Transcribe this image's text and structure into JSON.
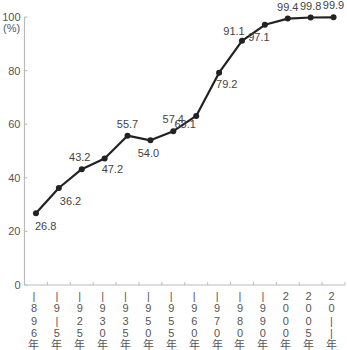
{
  "chart_data": {
    "type": "line",
    "title": "",
    "xlabel": "",
    "ylabel": "(%)",
    "ylim": [
      0,
      100
    ],
    "yticks": [
      0,
      20,
      40,
      60,
      80,
      100
    ],
    "grid": false,
    "legend": null,
    "categories": [
      "1896年",
      "1915年",
      "1925年",
      "1930年",
      "1935年",
      "1950年",
      "1955年",
      "1960年",
      "1970年",
      "1980年",
      "1990年",
      "2000年",
      "2005年",
      "2011年"
    ],
    "category_labels_vertical": [
      [
        "|",
        "8",
        "9",
        "6",
        "年"
      ],
      [
        "|",
        "9",
        "|",
        "5",
        "年"
      ],
      [
        "|",
        "9",
        "2",
        "5",
        "年"
      ],
      [
        "|",
        "9",
        "3",
        "0",
        "年"
      ],
      [
        "|",
        "9",
        "3",
        "5",
        "年"
      ],
      [
        "|",
        "9",
        "5",
        "0",
        "年"
      ],
      [
        "|",
        "9",
        "5",
        "5",
        "年"
      ],
      [
        "|",
        "9",
        "6",
        "0",
        "年"
      ],
      [
        "|",
        "9",
        "7",
        "0",
        "年"
      ],
      [
        "|",
        "9",
        "8",
        "0",
        "年"
      ],
      [
        "|",
        "9",
        "9",
        "0",
        "年"
      ],
      [
        "2",
        "0",
        "0",
        "0",
        "年"
      ],
      [
        "2",
        "0",
        "0",
        "5",
        "年"
      ],
      [
        "2",
        "0",
        "|",
        "|",
        "年"
      ]
    ],
    "values": [
      26.8,
      36.2,
      43.2,
      47.2,
      55.7,
      54.0,
      57.4,
      63.1,
      79.2,
      91.1,
      97.1,
      99.4,
      99.8,
      99.9
    ],
    "value_labels": [
      "26.8",
      "36.2",
      "43.2",
      "47.2",
      "55.7",
      "54.0",
      "57.4",
      "63.1",
      "79.2",
      "91.1",
      "97.1",
      "99.4",
      "99.8",
      "99.9"
    ],
    "label_positions": [
      "below",
      "below",
      "above",
      "below",
      "above",
      "below",
      "above",
      "below",
      "below",
      "above",
      "below",
      "above",
      "above",
      "above"
    ],
    "colors": {
      "line": "#222222",
      "axis": "#bbbbbb",
      "text": "#555555"
    }
  }
}
